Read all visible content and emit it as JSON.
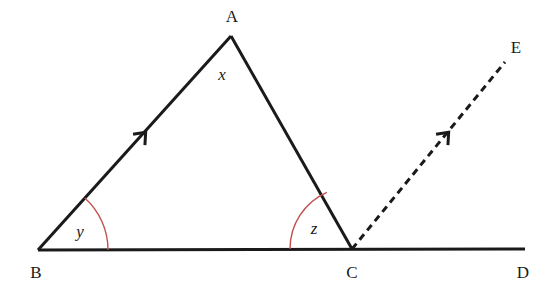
{
  "diagram": {
    "kind": "euclidean-geometry-figure",
    "colors": {
      "background": "#ffffff",
      "line": "#1a1a1a",
      "arc": "#c0504d",
      "label": "#1a1a1a"
    },
    "points": {
      "A": {
        "label": "A",
        "x": 231,
        "y": 36,
        "label_x": 232,
        "label_y": 16
      },
      "B": {
        "label": "B",
        "x": 38,
        "y": 250,
        "label_x": 36,
        "label_y": 272
      },
      "C": {
        "label": "C",
        "x": 352,
        "y": 249,
        "label_x": 352,
        "label_y": 272
      },
      "D": {
        "label": "D",
        "x": 525,
        "y": 249,
        "label_x": 523,
        "label_y": 272
      },
      "E": {
        "label": "E",
        "x": 505,
        "y": 62,
        "label_x": 516,
        "label_y": 47
      }
    },
    "segments": [
      {
        "name": "base-line-BD",
        "from": "B",
        "to": "D",
        "style": "solid",
        "width": 3
      },
      {
        "name": "side-AB",
        "from": "B",
        "to": "A",
        "style": "solid",
        "width": 3
      },
      {
        "name": "side-AC",
        "from": "A",
        "to": "C",
        "style": "solid",
        "width": 3
      },
      {
        "name": "ray-CE",
        "from": "C",
        "to": "E",
        "style": "dashed",
        "width": 3,
        "dash": "7 5"
      }
    ],
    "parallel_markers": [
      {
        "name": "arrow-marker-AB",
        "on": "side-AB",
        "x": 145,
        "y": 133,
        "angle_deg": -48
      },
      {
        "name": "arrow-marker-CE",
        "on": "ray-CE",
        "x": 448,
        "y": 133,
        "angle_deg": -48
      }
    ],
    "angles": [
      {
        "name": "angle-x-at-A",
        "label": "x",
        "vertex": "A",
        "radius": 54,
        "start_deg": 228,
        "end_deg": 312,
        "label_x": 222,
        "label_y": 74
      },
      {
        "name": "angle-y-at-B",
        "label": "y",
        "vertex": "B",
        "radius": 70,
        "start_deg": 312,
        "end_deg": 360,
        "label_x": 80,
        "label_y": 231
      },
      {
        "name": "angle-z-at-C",
        "label": "z",
        "vertex": "C",
        "radius": 62,
        "start_deg": 180,
        "end_deg": 246,
        "label_x": 314,
        "label_y": 228
      }
    ]
  }
}
